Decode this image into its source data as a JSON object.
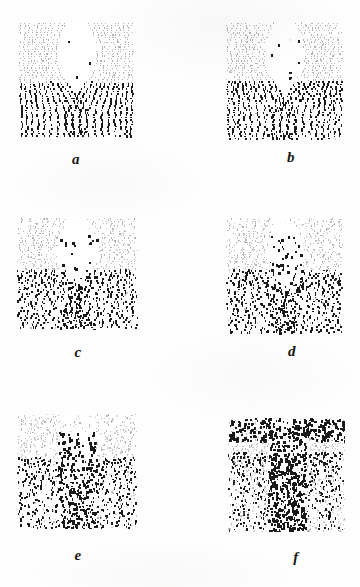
{
  "figure": {
    "kind": "multi-panel-dot-pattern-figure",
    "panel_count": 6,
    "columns": 2,
    "rows": 3,
    "background_color": "#fefefe",
    "ink_color": "#1a1a1a",
    "faint_ink_color": "#8d8d8d",
    "panels": [
      {
        "id": "a",
        "label": "a",
        "x": 19,
        "y": 22,
        "width": 115,
        "height": 116,
        "label_x": 56,
        "label_y": 152,
        "description": "dot streamlines, faint upper half, dense dark lower half, single central cusp",
        "noise": 0.1,
        "density": 0.98,
        "upper_fade": 0.8,
        "dark_band_start": 0.52,
        "seed": 11
      },
      {
        "id": "b",
        "label": "b",
        "x": 226,
        "y": 22,
        "width": 117,
        "height": 118,
        "label_x": 271,
        "label_y": 150,
        "description": "like a but with closed loop near top centre and wider dark lower band",
        "noise": 0.14,
        "density": 0.98,
        "upper_fade": 0.74,
        "dark_band_start": 0.5,
        "seed": 23
      },
      {
        "id": "c",
        "label": "c",
        "x": 17,
        "y": 218,
        "width": 121,
        "height": 112,
        "label_x": 58,
        "label_y": 345,
        "description": "wavier streamlines, dark blobs on central axis, broken contours in upper region",
        "noise": 0.26,
        "density": 0.95,
        "upper_fade": 0.62,
        "dark_band_start": 0.46,
        "seed": 37
      },
      {
        "id": "d",
        "label": "d",
        "x": 226,
        "y": 218,
        "width": 117,
        "height": 117,
        "label_x": 272,
        "label_y": 344,
        "description": "more disordered than c, central vertical chain of heavy dots",
        "noise": 0.33,
        "density": 0.93,
        "upper_fade": 0.58,
        "dark_band_start": 0.44,
        "seed": 53
      },
      {
        "id": "e",
        "label": "e",
        "x": 17,
        "y": 414,
        "width": 120,
        "height": 115,
        "label_x": 58,
        "label_y": 548,
        "description": "strongly scattered, thick dark branching trunk rising from lower centre",
        "noise": 0.52,
        "density": 0.8,
        "upper_fade": 0.45,
        "dark_band_start": 0.38,
        "seed": 71
      },
      {
        "id": "f",
        "label": "f",
        "x": 228,
        "y": 418,
        "width": 117,
        "height": 114,
        "label_x": 276,
        "label_y": 550,
        "description": "fully turbulent speckle, heavy dark arc across top and central column",
        "noise": 0.72,
        "density": 0.72,
        "upper_fade": 0.34,
        "dark_band_start": 0.3,
        "seed": 97
      }
    ]
  }
}
